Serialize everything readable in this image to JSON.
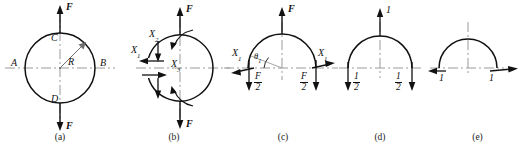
{
  "figure": {
    "stroke_color": "#111111",
    "centerline_color": "#9a9a9a",
    "background": "#ffffff",
    "subfigures": [
      {
        "id": "a",
        "caption": "(a)",
        "description": "Full circular ring of radius R loaded by opposite forces F at top and bottom",
        "labels": {
          "force_top": "F",
          "force_bottom": "F",
          "point_left": "A",
          "point_right": "B",
          "point_top": "C",
          "point_bottom": "D",
          "radius": "R"
        }
      },
      {
        "id": "b",
        "caption": "(b)",
        "description": "Ring cut at left section showing redundant internal forces",
        "labels": {
          "force_top": "F",
          "force_bottom": "F",
          "redundant_1": "X",
          "redundant_1_sub": "1",
          "redundant_2": "X",
          "redundant_2_sub": "2",
          "redundant_3": "X",
          "redundant_3_sub": "3"
        }
      },
      {
        "id": "c",
        "caption": "(c)",
        "description": "Upper half ring free body with redundant X1 and half load F/2 at each cut",
        "labels": {
          "force_top": "F",
          "redundant_left": "X",
          "redundant_left_sub": "1",
          "redundant_right": "X",
          "redundant_right_sub": "1",
          "angle": "θ",
          "angle_sub": "1",
          "reaction_left_num": "F",
          "reaction_left_den": "2",
          "reaction_right_num": "F",
          "reaction_right_den": "2"
        }
      },
      {
        "id": "d",
        "caption": "(d)",
        "description": "Unit load state: half ring with unit force 1 upward and 1/2 downward at each end",
        "labels": {
          "unit_load": "1",
          "reaction_left_num": "1",
          "reaction_left_den": "2",
          "reaction_right_num": "1",
          "reaction_right_den": "2"
        }
      },
      {
        "id": "e",
        "caption": "(e)",
        "description": "Unit redundant state: half ring with outward unit horizontal forces at both ends",
        "labels": {
          "unit_left": "1",
          "unit_right": "1"
        }
      }
    ]
  }
}
